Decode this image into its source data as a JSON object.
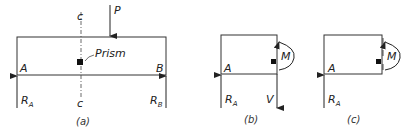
{
  "panel_a": {
    "caption": "(a)",
    "section_top": "c",
    "section_bottom": "c",
    "load": "P",
    "prism_label": "Prism",
    "support_left": "A",
    "support_right": "B",
    "reaction_left": "R",
    "reaction_left_sub": "A",
    "reaction_right": "R",
    "reaction_right_sub": "B"
  },
  "panel_b": {
    "caption": "(b)",
    "support": "A",
    "reaction": "R",
    "reaction_sub": "A",
    "moment": "M",
    "shear": "V"
  },
  "panel_c": {
    "caption": "(c)",
    "support": "A",
    "reaction": "R",
    "reaction_sub": "A",
    "moment": "M"
  }
}
